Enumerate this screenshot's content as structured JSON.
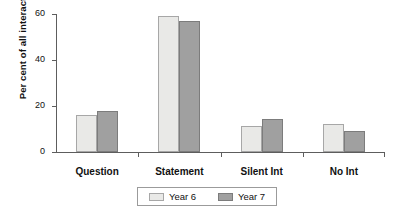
{
  "chart_data": {
    "type": "bar",
    "title": "",
    "xlabel": "",
    "ylabel": "Per cent of all interactions",
    "categories": [
      "Question",
      "Statement",
      "Silent Int",
      "No Int"
    ],
    "series": [
      {
        "name": "Year 6",
        "values": [
          16,
          59,
          11.5,
          12
        ],
        "color": "#e9e9e7"
      },
      {
        "name": "Year 7",
        "values": [
          18,
          57,
          14.5,
          9
        ],
        "color": "#a0a0a0"
      }
    ],
    "ylim": [
      0,
      60
    ],
    "yticks": [
      0,
      20,
      40,
      60
    ],
    "ytick_labels": [
      "0",
      "20",
      "40",
      "60"
    ],
    "grid": false,
    "legend_position": "bottom",
    "legend_entries": [
      "Year 6",
      "Year 7"
    ]
  }
}
